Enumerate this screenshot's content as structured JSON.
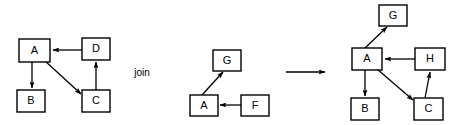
{
  "figure": {
    "type": "diagram",
    "subtype": "directed-graph-operation",
    "background_color": "#ffffff",
    "stroke_color": "#000000",
    "width": 463,
    "height": 125,
    "operator_label": "join",
    "transition_arrow": "right-arrow"
  },
  "panels": [
    {
      "id": "left-graph",
      "name": "left-operand-graph",
      "nodes": [
        {
          "id": "L-A",
          "label": "A",
          "x": 19,
          "y": 39,
          "w": 31,
          "h": 23
        },
        {
          "id": "L-D",
          "label": "D",
          "x": 82,
          "y": 38,
          "w": 28,
          "h": 22
        },
        {
          "id": "L-B",
          "label": "B",
          "x": 17,
          "y": 90,
          "w": 28,
          "h": 22
        },
        {
          "id": "L-C",
          "label": "C",
          "x": 82,
          "y": 90,
          "w": 28,
          "h": 22
        }
      ],
      "edges": [
        {
          "from": "D",
          "to": "A",
          "x1": 82,
          "y1": 50,
          "x2": 52,
          "y2": 50
        },
        {
          "from": "A",
          "to": "B",
          "x1": 32,
          "y1": 62,
          "x2": 32,
          "y2": 88
        },
        {
          "from": "A",
          "to": "C",
          "x1": 44,
          "y1": 60,
          "x2": 82,
          "y2": 95
        },
        {
          "from": "C",
          "to": "D",
          "x1": 96,
          "y1": 90,
          "x2": 96,
          "y2": 62
        }
      ]
    },
    {
      "id": "middle-graph",
      "name": "right-operand-graph",
      "nodes": [
        {
          "id": "M-G",
          "label": "G",
          "x": 213,
          "y": 50,
          "w": 28,
          "h": 21
        },
        {
          "id": "M-A",
          "label": "A",
          "x": 190,
          "y": 95,
          "w": 28,
          "h": 21
        },
        {
          "id": "M-F",
          "label": "F",
          "x": 241,
          "y": 95,
          "w": 28,
          "h": 21
        }
      ],
      "edges": [
        {
          "from": "A",
          "to": "G",
          "x1": 203,
          "y1": 95,
          "x2": 224,
          "y2": 72
        },
        {
          "from": "F",
          "to": "A",
          "x1": 241,
          "y1": 105,
          "x2": 220,
          "y2": 105
        }
      ]
    },
    {
      "id": "right-graph",
      "name": "result-graph",
      "nodes": [
        {
          "id": "R-G",
          "label": "G",
          "x": 379,
          "y": 5,
          "w": 28,
          "h": 21
        },
        {
          "id": "R-A",
          "label": "A",
          "x": 352,
          "y": 48,
          "w": 30,
          "h": 22
        },
        {
          "id": "R-H",
          "label": "H",
          "x": 415,
          "y": 48,
          "w": 30,
          "h": 22
        },
        {
          "id": "R-B",
          "label": "B",
          "x": 351,
          "y": 98,
          "w": 28,
          "h": 22
        },
        {
          "id": "R-C",
          "label": "C",
          "x": 414,
          "y": 98,
          "w": 29,
          "h": 22
        }
      ],
      "edges": [
        {
          "from": "A",
          "to": "G",
          "x1": 366,
          "y1": 48,
          "x2": 388,
          "y2": 27
        },
        {
          "from": "H",
          "to": "A",
          "x1": 415,
          "y1": 59,
          "x2": 384,
          "y2": 59
        },
        {
          "from": "A",
          "to": "B",
          "x1": 365,
          "y1": 70,
          "x2": 365,
          "y2": 96
        },
        {
          "from": "A",
          "to": "C",
          "x1": 377,
          "y1": 69,
          "x2": 414,
          "y2": 101
        },
        {
          "from": "C",
          "to": "H",
          "x1": 425,
          "y1": 98,
          "x2": 430,
          "y2": 71
        }
      ]
    }
  ],
  "transition": {
    "name": "transition-arrow",
    "x1": 286,
    "x2": 326,
    "y": 72
  },
  "operator": {
    "name": "join-operator-label",
    "label": "join",
    "x": 142,
    "y": 73
  }
}
